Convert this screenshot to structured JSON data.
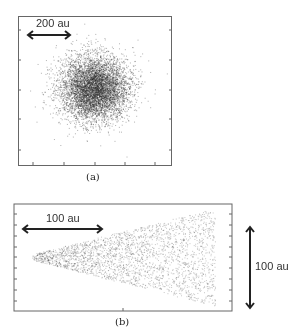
{
  "figure": {
    "panel_a": {
      "caption": "(a)",
      "scale_label": "200 au",
      "description": "Gaussian-like scatter cloud, densest at center"
    },
    "panel_b": {
      "caption": "(b)",
      "scale_label_horizontal": "100 au",
      "scale_label_vertical": "100 au",
      "description": "Cone-shaped scatter widening to the right"
    }
  },
  "colors": {
    "dots": "#222222",
    "frame": "#666666",
    "arrow": "#222222"
  }
}
